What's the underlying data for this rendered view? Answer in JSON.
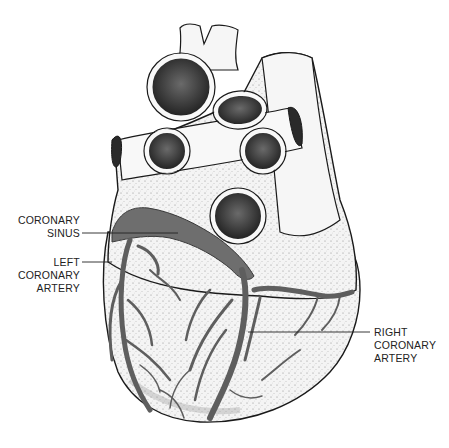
{
  "figure": {
    "colors": {
      "outline": "#1a1a1a",
      "tissue": "#f2f2f2",
      "stipple": "#9a9a9a",
      "vessel": "#6e6e6e",
      "vessel_dark": "#4a4a4a",
      "lumen": "#2a2a2a",
      "label": "#222222"
    }
  },
  "labels": {
    "coronary_sinus": {
      "line1": "CORONARY",
      "line2": "SINUS"
    },
    "left_coronary_artery": {
      "line1": "LEFT",
      "line2": "CORONARY",
      "line3": "ARTERY"
    },
    "right_coronary_artery": {
      "line1": "RIGHT",
      "line2": "CORONARY",
      "line3": "ARTERY"
    }
  }
}
